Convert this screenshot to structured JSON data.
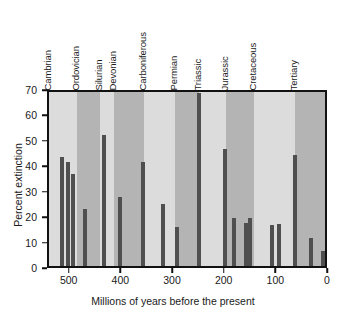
{
  "chart_data": {
    "type": "bar",
    "title": "",
    "xlabel": "Millions of years before the present",
    "ylabel": "Percent extinction",
    "xlim": [
      542,
      0
    ],
    "ylim": [
      0,
      70
    ],
    "x_reversed": true,
    "grid": false,
    "legend": "none",
    "yticks": [
      0,
      10,
      20,
      30,
      40,
      50,
      60,
      70
    ],
    "ytick_labels": [
      "0",
      "10",
      "20",
      "30",
      "40",
      "50",
      "60",
      "70"
    ],
    "xticks": [
      500,
      400,
      300,
      200,
      100,
      0
    ],
    "xtick_labels": [
      "500",
      "400",
      "300",
      "200",
      "100",
      "0"
    ],
    "bar_color": "#4f4f4f",
    "band_color_light": "#dcdcdc",
    "band_color_dark": "#b4b4b4",
    "periods": [
      {
        "name": "Cambrian",
        "start": 542,
        "end": 488,
        "shade": "light"
      },
      {
        "name": "Ordovician",
        "start": 488,
        "end": 444,
        "shade": "dark"
      },
      {
        "name": "Silurian",
        "start": 444,
        "end": 416,
        "shade": "light"
      },
      {
        "name": "Devonian",
        "start": 416,
        "end": 359,
        "shade": "dark"
      },
      {
        "name": "Carboniferous",
        "start": 359,
        "end": 299,
        "shade": "light"
      },
      {
        "name": "Permian",
        "start": 299,
        "end": 251,
        "shade": "dark"
      },
      {
        "name": "Triassic",
        "start": 251,
        "end": 200,
        "shade": "light"
      },
      {
        "name": "Jurassic",
        "start": 200,
        "end": 145,
        "shade": "dark"
      },
      {
        "name": "Cretaceous",
        "start": 145,
        "end": 65,
        "shade": "light"
      },
      {
        "name": "Tertiary",
        "start": 65,
        "end": 0,
        "shade": "dark"
      }
    ],
    "x": [
      517,
      505,
      495,
      473,
      436,
      405,
      394,
      360,
      322,
      312,
      251,
      233,
      200,
      186,
      160,
      150,
      110,
      94,
      65,
      36,
      13
    ],
    "values": [
      43.0,
      41.0,
      36.0,
      22.5,
      51.5,
      27.0,
      41.0,
      24.5,
      15.5,
      68.0,
      46.0,
      19.0,
      17.0,
      19.0,
      16.0,
      16.5,
      43.5,
      11.0,
      6.0,
      0,
      0
    ],
    "bars": [
      {
        "age": 517,
        "percent": 43.0
      },
      {
        "age": 505,
        "percent": 41.0
      },
      {
        "age": 495,
        "percent": 36.0
      },
      {
        "age": 473,
        "percent": 22.5
      },
      {
        "age": 436,
        "percent": 51.5
      },
      {
        "age": 405,
        "percent": 27.0
      },
      {
        "age": 360,
        "percent": 41.0
      },
      {
        "age": 322,
        "percent": 24.5
      },
      {
        "age": 295,
        "percent": 15.5
      },
      {
        "age": 251,
        "percent": 68.0
      },
      {
        "age": 201,
        "percent": 46.0
      },
      {
        "age": 183,
        "percent": 19.0
      },
      {
        "age": 160,
        "percent": 17.0
      },
      {
        "age": 152,
        "percent": 19.0
      },
      {
        "age": 110,
        "percent": 16.0
      },
      {
        "age": 97,
        "percent": 16.5
      },
      {
        "age": 65,
        "percent": 43.5
      },
      {
        "age": 35,
        "percent": 11.0
      },
      {
        "age": 12,
        "percent": 6.0
      }
    ]
  }
}
